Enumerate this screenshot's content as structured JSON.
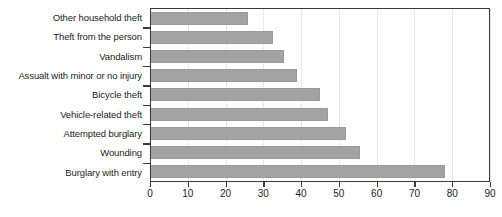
{
  "chart_data": {
    "type": "bar",
    "orientation": "horizontal",
    "title": "",
    "xlabel": "",
    "ylabel": "",
    "xlim": [
      0,
      90
    ],
    "xticks": [
      0,
      10,
      20,
      30,
      40,
      50,
      60,
      70,
      80,
      90
    ],
    "xtick_labels": [
      "0",
      "10",
      "20",
      "30",
      "40",
      "50",
      "60",
      "70",
      "80",
      "90"
    ],
    "grid": true,
    "grid_axis": "x",
    "legend": false,
    "bar_color": "#a3a3a3",
    "axis_color": "#3a3a3a",
    "grid_color": "#d8d8d8",
    "text_color": "#1d1d1d",
    "categories": [
      "Other household theft",
      "Theft from the person",
      "Vandalism",
      "Assualt with minor or no injury",
      "Bicycle theft",
      "Vehicle-related theft",
      "Attempted burglary",
      "Wounding",
      "Burglary with entry"
    ],
    "values": [
      26,
      32.5,
      35.5,
      39,
      45,
      47,
      52,
      55.5,
      78
    ]
  }
}
